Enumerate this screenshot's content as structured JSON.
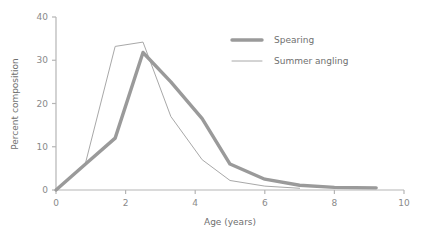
{
  "chart_data": {
    "type": "line",
    "title": "",
    "xlabel": "Age (years)",
    "ylabel": "Percent composition",
    "xlim": [
      0,
      10
    ],
    "ylim": [
      0,
      40
    ],
    "xticks": [
      "0",
      "2",
      "4",
      "6",
      "8",
      "10"
    ],
    "yticks": [
      "0",
      "10",
      "20",
      "30",
      "40"
    ],
    "xtick_values": [
      0,
      2,
      4,
      6,
      8,
      10
    ],
    "ytick_values": [
      0,
      10,
      20,
      30,
      40
    ],
    "grid": false,
    "legend_position": "upper right",
    "series": [
      {
        "name": "Spearing",
        "color": "#9a9a9a",
        "line_width": 3.4,
        "points": [
          {
            "x": 0.0,
            "y": 0.0
          },
          {
            "x": 0.85,
            "y": 6.0
          },
          {
            "x": 1.7,
            "y": 12.0
          },
          {
            "x": 2.5,
            "y": 31.8
          },
          {
            "x": 3.3,
            "y": 25.0
          },
          {
            "x": 4.2,
            "y": 16.5
          },
          {
            "x": 5.0,
            "y": 6.0
          },
          {
            "x": 6.0,
            "y": 2.5
          },
          {
            "x": 7.0,
            "y": 1.1
          },
          {
            "x": 8.0,
            "y": 0.6
          },
          {
            "x": 9.2,
            "y": 0.5
          }
        ]
      },
      {
        "name": "Summer angling",
        "color": "#a8a8a8",
        "line_width": 1.0,
        "points": [
          {
            "x": 0.0,
            "y": 0.0
          },
          {
            "x": 0.85,
            "y": 6.3
          },
          {
            "x": 1.7,
            "y": 33.2
          },
          {
            "x": 2.5,
            "y": 34.2
          },
          {
            "x": 3.3,
            "y": 17.0
          },
          {
            "x": 4.2,
            "y": 7.0
          },
          {
            "x": 5.0,
            "y": 2.2
          },
          {
            "x": 6.0,
            "y": 0.9
          },
          {
            "x": 7.0,
            "y": 0.4
          }
        ]
      }
    ]
  },
  "legend": {
    "items": [
      {
        "label": "Spearing"
      },
      {
        "label": "Summer angling"
      }
    ]
  },
  "axes": {
    "x_title": "Age (years)",
    "y_title": "Percent composition"
  }
}
